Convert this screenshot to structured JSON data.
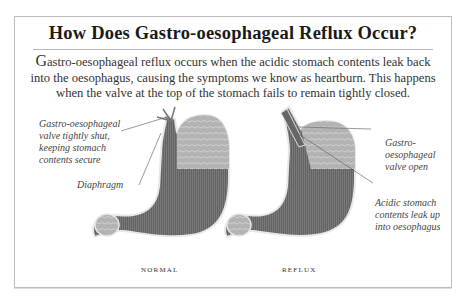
{
  "figure": {
    "title": "How Does Gastro-oesophageal Reflux Occur?",
    "intro": {
      "first_letter": "G",
      "text": "astro-oesophageal reflux occurs when the acidic stomach contents leak back into the oesophagus, causing the symptoms we know as heartburn. This happens when the valve at the top of the stomach fails to remain tightly closed."
    },
    "panels": [
      {
        "caption": "NORMAL",
        "labels": [
          {
            "id": "valve",
            "lines": [
              "Gastro-oesophageal",
              "valve tightly shut,",
              "keeping stomach",
              "contents secure"
            ]
          },
          {
            "id": "diaphragm",
            "lines": [
              "Diaphragm"
            ]
          }
        ]
      },
      {
        "caption": "REFLUX",
        "labels": [
          {
            "id": "valve-open",
            "lines": [
              "Gastro-",
              "oesophageal",
              "valve open"
            ]
          },
          {
            "id": "acid",
            "lines": [
              "Acidic stomach",
              "contents leak up",
              "into oesophagus"
            ]
          }
        ]
      }
    ],
    "colors": {
      "frame_border": "#bdbdbd",
      "stomach_dark": "#6e6e6e",
      "stomach_light": "#a9a9a9",
      "outline": "#e8e8e8"
    }
  }
}
